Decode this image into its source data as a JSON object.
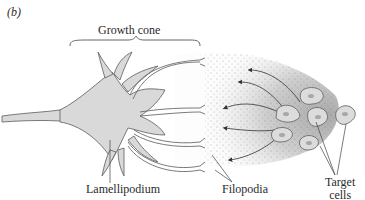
{
  "figure": {
    "panel_label": "(b)",
    "labels": {
      "growth_cone": "Growth cone",
      "lamellipodium": "Lamellipodium",
      "filopodia": "Filopodia",
      "target_cells_line1": "Target",
      "target_cells_line2": "cells"
    },
    "colors": {
      "outline": "#6b6b6b",
      "cone_fill": "#d9d9d9",
      "gradient_start": "#e6e6e6",
      "gradient_end": "#b5b5b5",
      "cell_fill": "#dcdcdc",
      "nucleus_fill": "#a8a8a8",
      "text": "#2a2a2a"
    },
    "elements": {
      "chemoattractant_arrows": 5,
      "target_cells": 7
    }
  }
}
